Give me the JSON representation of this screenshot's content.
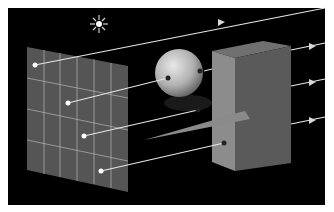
{
  "diagram": {
    "colors": {
      "background": "#ffffff",
      "scene": "#000000",
      "grid_fill": "#5a5a5a",
      "grid_lines": "#c8c8c8",
      "ray": "#e6e6e6",
      "sphere_light": "#e0e0e0",
      "sphere_dark": "#6e6e6e",
      "box_front": "#8a8a8a",
      "box_side": "#5c5c5c",
      "box_top": "#707070",
      "triangle": "#8c8c8c",
      "light_source": "#ffffff"
    },
    "elements": [
      {
        "name": "light-source",
        "shape": "sun"
      },
      {
        "name": "image-plane",
        "shape": "grid",
        "rows": 4,
        "cols": 6
      },
      {
        "name": "sphere",
        "shape": "sphere"
      },
      {
        "name": "box",
        "shape": "cuboid"
      },
      {
        "name": "triangle",
        "shape": "triangle"
      }
    ],
    "rays": [
      {
        "from": "image-plane",
        "to": "scene-exit",
        "arrow": true
      },
      {
        "from": "image-plane",
        "to": "sphere"
      },
      {
        "from": "image-plane",
        "to": "triangle"
      },
      {
        "from": "image-plane",
        "to": "box"
      },
      {
        "from": "sphere",
        "to": "box"
      },
      {
        "from": "box",
        "to": "scene-exit",
        "arrow": true
      },
      {
        "from": "box",
        "to": "scene-exit",
        "arrow": true
      },
      {
        "from": "box",
        "to": "scene-exit",
        "arrow": true
      }
    ]
  }
}
